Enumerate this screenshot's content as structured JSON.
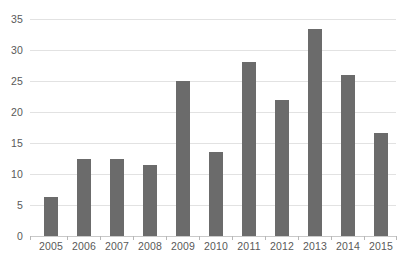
{
  "chart_data": {
    "type": "bar",
    "title": "",
    "subtitle": "",
    "xlabel": "",
    "ylabel": "",
    "categories": [
      "2005",
      "2006",
      "2007",
      "2008",
      "2009",
      "2010",
      "2011",
      "2012",
      "2013",
      "2014",
      "2015"
    ],
    "values": [
      6,
      12,
      12,
      11,
      24,
      13,
      27,
      21,
      32,
      25,
      16
    ],
    "ylim": [
      0,
      35
    ],
    "yticks": [
      0,
      5,
      10,
      15,
      20,
      25,
      30,
      35
    ],
    "ytick_labels": [
      "0",
      "5",
      "10",
      "15",
      "20",
      "25",
      "30",
      "35"
    ],
    "grid": true,
    "legend": false,
    "legend_position": "none",
    "annotations": [],
    "colors": {
      "bar": "#6b6b6b",
      "gridline": "#e2e2e2",
      "axis": "#c9c9c9",
      "tick": "#b8b8b8",
      "label_text": "#595959",
      "background": "#ffffff"
    }
  }
}
